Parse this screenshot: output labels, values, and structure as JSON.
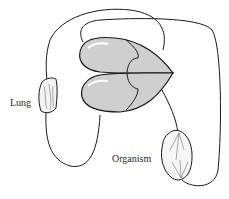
{
  "diagram": {
    "type": "circulatory-system-schematic",
    "nodes": [
      {
        "id": "heart",
        "label": ""
      },
      {
        "id": "lung",
        "label": "Lung"
      },
      {
        "id": "organism",
        "label": "Organism"
      }
    ],
    "labels": {
      "lung": "Lung",
      "organism": "Organism"
    },
    "colors": {
      "heart_fill": "#cfcfcf",
      "stroke": "#1a1a1a",
      "background": "#ffffff"
    }
  }
}
